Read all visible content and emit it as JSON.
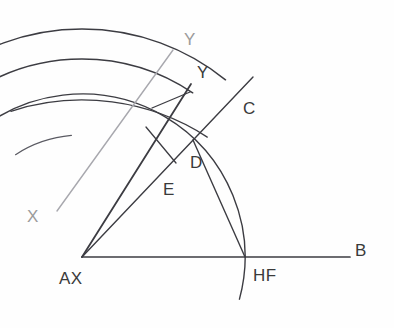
{
  "diagram": {
    "background_color": "#fefefe",
    "ink_color": "#3c3c42",
    "faint_ink_color": "#a8a8ae",
    "labels": [
      {
        "id": "label-y-upper",
        "text": "Y",
        "x": 184,
        "y": 45,
        "tone": "faint"
      },
      {
        "id": "label-y-lower",
        "text": "Y",
        "x": 197,
        "y": 78,
        "tone": "dark"
      },
      {
        "id": "label-c",
        "text": "C",
        "x": 243,
        "y": 114,
        "tone": "dark"
      },
      {
        "id": "label-d",
        "text": "D",
        "x": 190,
        "y": 168,
        "tone": "dark"
      },
      {
        "id": "label-e",
        "text": "E",
        "x": 163,
        "y": 195,
        "tone": "dark"
      },
      {
        "id": "label-x",
        "text": "X",
        "x": 27,
        "y": 222,
        "tone": "faint"
      },
      {
        "id": "label-b",
        "text": "B",
        "x": 355,
        "y": 256,
        "tone": "dark"
      },
      {
        "id": "label-ax",
        "text": "AX",
        "x": 59,
        "y": 284,
        "tone": "dark"
      },
      {
        "id": "label-hf",
        "text": "HF",
        "x": 253,
        "y": 281,
        "tone": "dark"
      }
    ],
    "points": {
      "AX": {
        "x": 82,
        "y": 257
      },
      "HF": {
        "x": 245,
        "y": 257
      },
      "D": {
        "x": 193,
        "y": 140
      },
      "E": {
        "x": 160,
        "y": 155
      },
      "B": {
        "x": 350,
        "y": 257
      }
    },
    "segments": [
      {
        "id": "baseline-ax-b",
        "name": "base-line-AX-to-B",
        "x1": 82,
        "y1": 257,
        "x2": 350,
        "y2": 257,
        "tone": "dark",
        "width": 1.7
      },
      {
        "id": "ray-ax-c",
        "name": "ray-AX-through-C",
        "x1": 82,
        "y1": 257,
        "x2": 253,
        "y2": 77,
        "tone": "dark",
        "width": 1.4
      },
      {
        "id": "ray-ax-y",
        "name": "ray-AX-through-Y",
        "x1": 82,
        "y1": 257,
        "x2": 191,
        "y2": 84,
        "tone": "dark",
        "width": 1.8
      },
      {
        "id": "line-d-hf",
        "name": "segment-D-to-HF",
        "x1": 193,
        "y1": 140,
        "x2": 245,
        "y2": 257,
        "tone": "dark",
        "width": 1.4
      },
      {
        "id": "line-xy-faint",
        "name": "axis-line-X-to-Y",
        "x1": 57,
        "y1": 211,
        "x2": 173,
        "y2": 50,
        "tone": "faint",
        "width": 1.4
      },
      {
        "id": "tick-e-short",
        "name": "tick-near-E",
        "x1": 146,
        "y1": 127,
        "x2": 176,
        "y2": 163,
        "tone": "dark",
        "width": 1.3
      },
      {
        "id": "tick-d-short",
        "name": "tick-near-D",
        "x1": 152,
        "y1": 108,
        "x2": 190,
        "y2": 92,
        "tone": "dark",
        "width": 1.3
      }
    ],
    "arcs": [
      {
        "id": "arc-outer",
        "name": "outer-arc",
        "cx": 82,
        "cy": 257,
        "r": 228,
        "a1": 129,
        "a2": 51,
        "tone": "dark",
        "width": 1.5
      },
      {
        "id": "arc-middle",
        "name": "middle-arc",
        "cx": 82,
        "cy": 257,
        "r": 198,
        "a1": 124,
        "a2": 56,
        "tone": "dark",
        "width": 1.4
      },
      {
        "id": "arc-mid-flat",
        "name": "flat-chord-arc",
        "cx": 82,
        "cy": 330,
        "r": 230,
        "a1": 108,
        "a2": 57,
        "tone": "dark",
        "width": 1.3
      },
      {
        "id": "arc-hf",
        "name": "arc-through-HF",
        "cx": 82,
        "cy": 257,
        "r": 163,
        "a1": 134,
        "a2": -15,
        "tone": "dark",
        "width": 1.4
      },
      {
        "id": "arc-small-e",
        "name": "small-arc-near-E",
        "cx": 82,
        "cy": 257,
        "r": 122,
        "a1": 123,
        "a2": 95,
        "tone": "mid",
        "width": 1.2
      }
    ]
  }
}
